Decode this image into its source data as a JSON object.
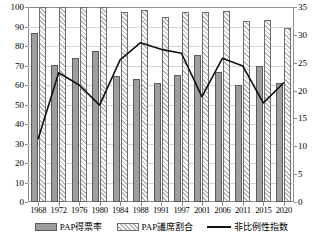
{
  "chart_data": {
    "type": "bar",
    "title": "",
    "xlabel": "",
    "ylabel": "",
    "grid": true,
    "legend_position": "bottom",
    "categories": [
      "1968",
      "1972",
      "1976",
      "1980",
      "1984",
      "1988",
      "1991",
      "1997",
      "2001",
      "2006",
      "2011",
      "2015",
      "2020"
    ],
    "axes": {
      "left": {
        "label": "",
        "min": 0,
        "max": 100,
        "step": 10,
        "ticks": [
          "0",
          "10",
          "20",
          "30",
          "40",
          "50",
          "60",
          "70",
          "80",
          "90",
          "100"
        ]
      },
      "right": {
        "label": "",
        "min": 0,
        "max": 35,
        "step": 5,
        "ticks": [
          "0",
          "5",
          "10",
          "15",
          "20",
          "25",
          "30",
          "35"
        ]
      }
    },
    "series": [
      {
        "name": "PAP得票率",
        "axis": "left",
        "kind": "bar",
        "style": "solid-gray",
        "color": "#9e9e9e",
        "values": [
          86.7,
          70.4,
          74.1,
          77.7,
          64.8,
          63.2,
          61.0,
          65.0,
          75.3,
          66.6,
          60.1,
          69.9,
          61.2
        ]
      },
      {
        "name": "PAP議席割合",
        "axis": "left",
        "kind": "bar",
        "style": "hatched",
        "color": "#b5b5b5",
        "values": [
          100.0,
          100.0,
          100.0,
          100.0,
          97.5,
          98.7,
          95.1,
          97.6,
          97.6,
          98.0,
          93.0,
          93.5,
          89.2
        ]
      },
      {
        "name": "非比例性指数",
        "axis": "right",
        "kind": "line",
        "color": "#111111",
        "values": [
          11.4,
          23.2,
          21.0,
          17.4,
          25.5,
          28.6,
          27.4,
          26.7,
          18.9,
          25.8,
          24.4,
          17.8,
          21.4
        ]
      }
    ]
  },
  "legend": {
    "items": [
      {
        "label": "PAP得票率",
        "swatch": "solid-gray-swatch"
      },
      {
        "label": "PAP議席割合",
        "swatch": "hatched-swatch"
      },
      {
        "label": "非比例性指数",
        "swatch": "line-swatch"
      }
    ]
  }
}
